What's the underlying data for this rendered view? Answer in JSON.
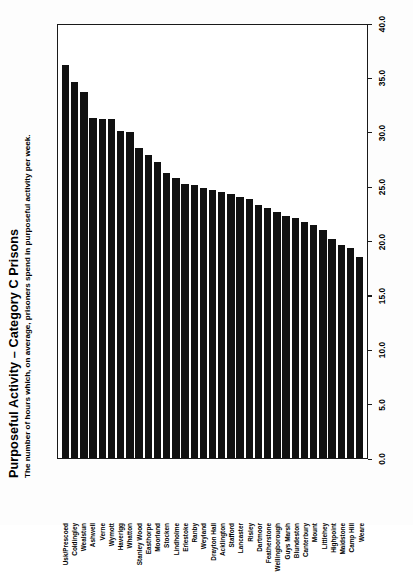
{
  "header": {
    "title": "Purposeful Activity – Category C Prisons",
    "subtitle": "The number of hours which, on average, prisoners spend in purposeful activity per week."
  },
  "axis": {
    "tick_labels": [
      "0.0",
      "5.0",
      "10.0",
      "15.0",
      "20.0",
      "25.0",
      "30.0",
      "35.0",
      "40.0"
    ]
  },
  "chart_data": {
    "type": "bar",
    "title": "Purposeful Activity – Category C Prisons",
    "subtitle": "The number of hours which, on average, prisoners spend in purposeful activity per week.",
    "orientation": "vertical-bars-rotated-page",
    "xlabel": "",
    "ylabel": "",
    "ylim": [
      0.0,
      40.0
    ],
    "ytick_interval": 5.0,
    "yticks": [
      0.0,
      5.0,
      10.0,
      15.0,
      20.0,
      25.0,
      30.0,
      35.0,
      40.0
    ],
    "grid": false,
    "legend": false,
    "bar_color": "#111111",
    "categories": [
      "Usk/Prescoed",
      "Coldingley",
      "Wealstun",
      "Ashwell",
      "Verne",
      "Wymott",
      "Haverigg",
      "Whatton",
      "Stanley Wood",
      "Easthorpe",
      "Moorland",
      "Stocken",
      "Lindholme",
      "Erlestoke",
      "Ranby",
      "Weyland",
      "Drayton Hall",
      "Acklington",
      "Stafford",
      "Lancaster",
      "Risley",
      "Dartmoor",
      "Featherstone",
      "Wellingborough",
      "Guys Marsh",
      "Blundeston",
      "Canterbury",
      "Mount",
      "Littlehey",
      "Highpoint",
      "Maidstone",
      "Camp Hill",
      "Weare"
    ],
    "values": [
      36.3,
      34.7,
      33.8,
      31.4,
      31.3,
      31.3,
      30.2,
      30.1,
      28.6,
      28.0,
      27.3,
      26.3,
      25.9,
      25.3,
      25.2,
      24.9,
      24.8,
      24.6,
      24.4,
      24.1,
      23.9,
      23.4,
      23.1,
      22.7,
      22.4,
      22.2,
      21.8,
      21.5,
      21.1,
      20.2,
      19.7,
      19.4,
      18.6
    ]
  }
}
